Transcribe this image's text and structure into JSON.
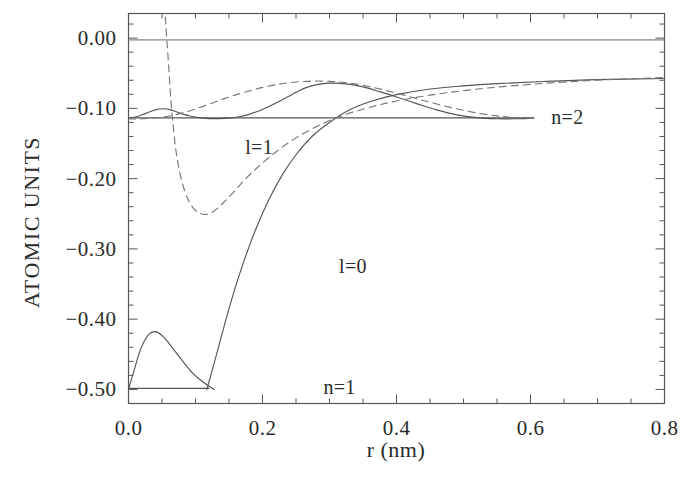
{
  "chart_data": {
    "type": "line",
    "title": "",
    "xlabel": "r (nm)",
    "ylabel": "ATOMIC UNITS",
    "xlim": [
      0.0,
      0.8
    ],
    "ylim": [
      -0.52,
      0.035
    ],
    "grid": false,
    "legend_position": "inline-annotations",
    "xticks": [
      0.0,
      0.2,
      0.4,
      0.6,
      0.8
    ],
    "xtick_labels": [
      "0.0",
      "0.2",
      "0.4",
      "0.6",
      "0.8"
    ],
    "yticks": [
      0.0,
      -0.1,
      -0.2,
      -0.3,
      -0.4,
      -0.5
    ],
    "ytick_labels": [
      "0.00",
      "-0.10",
      "-0.20",
      "-0.30",
      "-0.40",
      "-0.50"
    ],
    "xtick_minor_step": 0.05,
    "ytick_minor_step": 0.02,
    "annotations": [
      {
        "text": "l=1",
        "x": 0.195,
        "y": -0.155
      },
      {
        "text": "l=0",
        "x": 0.335,
        "y": -0.325
      },
      {
        "text": "n=1",
        "x": 0.315,
        "y": -0.497
      },
      {
        "text": "n=2",
        "x": 0.655,
        "y": -0.112
      }
    ],
    "series": [
      {
        "name": "n=1 energy level",
        "style": "solid",
        "color": "#555555",
        "points": [
          [
            0.0,
            -0.4985
          ],
          [
            0.12,
            -0.4985
          ]
        ]
      },
      {
        "name": "n=2 energy level",
        "style": "solid",
        "color": "#555555",
        "points": [
          [
            0.0,
            -0.1135
          ],
          [
            0.605,
            -0.1135
          ]
        ]
      },
      {
        "name": "zero energy reference",
        "style": "solid",
        "color": "#888888",
        "points": [
          [
            0.0,
            -0.0025
          ],
          [
            0.8,
            -0.0025
          ]
        ]
      },
      {
        "name": "l=0 n=1 radial wavefunction",
        "style": "solid",
        "color": "#555555",
        "points": [
          [
            0.0,
            -0.5
          ],
          [
            0.008,
            -0.474
          ],
          [
            0.018,
            -0.443
          ],
          [
            0.03,
            -0.422
          ],
          [
            0.042,
            -0.418
          ],
          [
            0.055,
            -0.428
          ],
          [
            0.068,
            -0.444
          ],
          [
            0.082,
            -0.461
          ],
          [
            0.095,
            -0.476
          ],
          [
            0.108,
            -0.487
          ],
          [
            0.118,
            -0.494
          ],
          [
            0.128,
            -0.5
          ]
        ]
      },
      {
        "name": "l=0 n=2 radial wavefunction",
        "style": "solid",
        "color": "#555555",
        "points": [
          [
            0.117,
            -0.5
          ],
          [
            0.13,
            -0.455
          ],
          [
            0.145,
            -0.402
          ],
          [
            0.16,
            -0.353
          ],
          [
            0.175,
            -0.31
          ],
          [
            0.19,
            -0.272
          ],
          [
            0.21,
            -0.229
          ],
          [
            0.23,
            -0.194
          ],
          [
            0.25,
            -0.166
          ],
          [
            0.275,
            -0.139
          ],
          [
            0.3,
            -0.12
          ],
          [
            0.33,
            -0.102
          ],
          [
            0.36,
            -0.0905
          ],
          [
            0.4,
            -0.0805
          ],
          [
            0.45,
            -0.0725
          ],
          [
            0.5,
            -0.068
          ],
          [
            0.55,
            -0.0648
          ],
          [
            0.62,
            -0.0618
          ],
          [
            0.7,
            -0.0592
          ],
          [
            0.8,
            -0.0575
          ]
        ]
      },
      {
        "name": "l=0 upper oscillating wavefunction",
        "style": "solid",
        "color": "#555555",
        "points": [
          [
            0.0,
            -0.1135
          ],
          [
            0.012,
            -0.112
          ],
          [
            0.025,
            -0.1075
          ],
          [
            0.04,
            -0.1022
          ],
          [
            0.052,
            -0.1005
          ],
          [
            0.062,
            -0.1018
          ],
          [
            0.075,
            -0.1062
          ],
          [
            0.09,
            -0.1105
          ],
          [
            0.105,
            -0.1132
          ],
          [
            0.12,
            -0.1145
          ],
          [
            0.135,
            -0.1145
          ],
          [
            0.15,
            -0.1138
          ],
          [
            0.165,
            -0.112
          ],
          [
            0.18,
            -0.1085
          ],
          [
            0.2,
            -0.1015
          ],
          [
            0.22,
            -0.0925
          ],
          [
            0.245,
            -0.0798
          ],
          [
            0.265,
            -0.0705
          ],
          [
            0.285,
            -0.0655
          ],
          [
            0.305,
            -0.064
          ],
          [
            0.325,
            -0.0652
          ],
          [
            0.35,
            -0.0695
          ],
          [
            0.375,
            -0.0762
          ],
          [
            0.4,
            -0.0838
          ],
          [
            0.43,
            -0.0932
          ],
          [
            0.46,
            -0.1022
          ],
          [
            0.49,
            -0.1092
          ],
          [
            0.52,
            -0.1132
          ],
          [
            0.55,
            -0.1148
          ],
          [
            0.58,
            -0.1148
          ],
          [
            0.605,
            -0.1142
          ]
        ]
      },
      {
        "name": "l=1 inner dashed wavefunction",
        "style": "dashed",
        "color": "#777777",
        "points": [
          [
            0.055,
            0.03
          ],
          [
            0.057,
            0.0
          ],
          [
            0.06,
            -0.04
          ],
          [
            0.063,
            -0.085
          ],
          [
            0.067,
            -0.128
          ],
          [
            0.072,
            -0.168
          ],
          [
            0.08,
            -0.205
          ],
          [
            0.09,
            -0.232
          ],
          [
            0.102,
            -0.247
          ],
          [
            0.115,
            -0.251
          ],
          [
            0.128,
            -0.246
          ],
          [
            0.142,
            -0.234
          ],
          [
            0.158,
            -0.218
          ],
          [
            0.175,
            -0.2
          ],
          [
            0.195,
            -0.182
          ],
          [
            0.22,
            -0.162
          ],
          [
            0.25,
            -0.142
          ],
          [
            0.285,
            -0.124
          ],
          [
            0.32,
            -0.11
          ],
          [
            0.36,
            -0.0985
          ],
          [
            0.4,
            -0.0895
          ],
          [
            0.45,
            -0.0812
          ],
          [
            0.5,
            -0.0748
          ],
          [
            0.55,
            -0.0698
          ],
          [
            0.62,
            -0.0645
          ],
          [
            0.7,
            -0.0598
          ],
          [
            0.8,
            -0.0562
          ]
        ]
      },
      {
        "name": "l=1 upper dashed wavefunction",
        "style": "dashed",
        "color": "#777777",
        "points": [
          [
            0.0,
            -0.1152
          ],
          [
            0.02,
            -0.1148
          ],
          [
            0.04,
            -0.1135
          ],
          [
            0.06,
            -0.1112
          ],
          [
            0.08,
            -0.1068
          ],
          [
            0.1,
            -0.1008
          ],
          [
            0.12,
            -0.0942
          ],
          [
            0.14,
            -0.0872
          ],
          [
            0.16,
            -0.0808
          ],
          [
            0.18,
            -0.0752
          ],
          [
            0.2,
            -0.0702
          ],
          [
            0.225,
            -0.0655
          ],
          [
            0.25,
            -0.0625
          ],
          [
            0.275,
            -0.0612
          ],
          [
            0.3,
            -0.0615
          ],
          [
            0.325,
            -0.0635
          ],
          [
            0.35,
            -0.0672
          ],
          [
            0.38,
            -0.0735
          ],
          [
            0.41,
            -0.0808
          ],
          [
            0.44,
            -0.0888
          ],
          [
            0.47,
            -0.0962
          ],
          [
            0.5,
            -0.1028
          ],
          [
            0.53,
            -0.1082
          ],
          [
            0.56,
            -0.1118
          ],
          [
            0.585,
            -0.1135
          ],
          [
            0.605,
            -0.1142
          ]
        ]
      }
    ]
  },
  "axes": {
    "frame_color": "#555555"
  }
}
